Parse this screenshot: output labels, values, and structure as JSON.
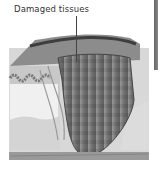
{
  "diagram": {
    "label": "Damaged tissues",
    "colors": {
      "skin_top": "#8a8a8a",
      "dermis": "#cfcfcf",
      "fat_layer": "#e6e6e6",
      "damaged_tissue": "#7a7a7a",
      "bottom_layer": "#9a9a9a"
    }
  }
}
